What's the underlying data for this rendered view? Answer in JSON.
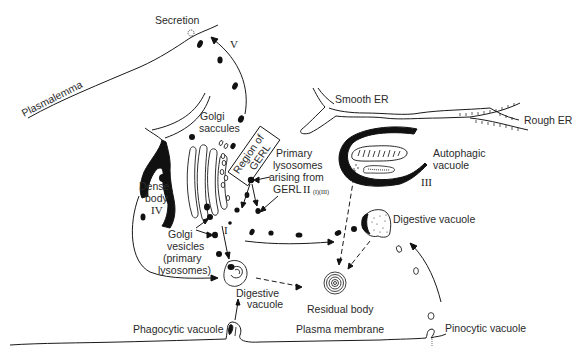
{
  "diagram": {
    "labels": {
      "secretion": "Secretion",
      "plasmalemma": "Plasmalemma",
      "smooth_er": "Smooth ER",
      "rough_er": "Rough ER",
      "golgi_saccules_1": "Golgi",
      "golgi_saccules_2": "saccules",
      "region_gerl_1": "Region of",
      "region_gerl_2": "GERL",
      "primary_lysosomes_1": "Primary",
      "primary_lysosomes_2": "lysosomes",
      "primary_lysosomes_3": "arising from",
      "primary_lysosomes_4": "GERL",
      "autophagic_1": "Autophagic",
      "autophagic_2": "vacuole",
      "dense_body_1": "Dense",
      "dense_body_2": "body",
      "golgi_vesicles_1": "Golgi",
      "golgi_vesicles_2": "vesicles",
      "golgi_vesicles_3": "(primary",
      "golgi_vesicles_4": "lysosomes)",
      "digestive_vacuole_right": "Digestive vacuole",
      "digestive_vacuole_left_1": "Digestive",
      "digestive_vacuole_left_2": "vacuole",
      "residual_body": "Residual body",
      "phagocytic_vacuole": "Phagocytic vacuole",
      "plasma_membrane": "Plasma membrane",
      "pinocytic_vacuole": "Pinocytic vacuole"
    },
    "pathway_numerals": {
      "I": "I",
      "II": "II",
      "II_sub": "(I)(III)",
      "III": "III",
      "IV": "IV",
      "V": "V"
    }
  }
}
